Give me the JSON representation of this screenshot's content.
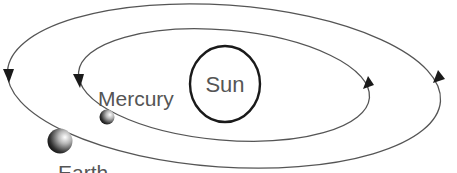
{
  "diagram": {
    "title": "",
    "sun": {
      "label": "Sun"
    },
    "planets": [
      {
        "name": "Mercury",
        "label": "Mercury",
        "orbit": "inner"
      },
      {
        "name": "Earth",
        "label": "Earth",
        "orbit": "outer"
      }
    ],
    "orbit_direction": "counterclockwise",
    "colors": {
      "orbit_line": "#555555",
      "arrowhead": "#1a1a1a",
      "sun_outline": "#1a1a1a",
      "label_text": "#555555",
      "background": "#ffffff"
    }
  }
}
